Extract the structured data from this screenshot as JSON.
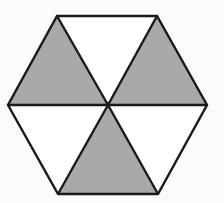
{
  "diagram": {
    "title": "",
    "shape": "regular hexagon divided into six triangles",
    "colors": {
      "background": "#fbfbfb",
      "shaded": "#a9a9a9",
      "unshaded": "#ffffff",
      "stroke": "#1a1a1a"
    },
    "stroke_width": 2.4,
    "center": [
      108,
      105
    ],
    "vertices": {
      "top_left": [
        57,
        16
      ],
      "top_right": [
        157,
        16
      ],
      "right": [
        207,
        105
      ],
      "bottom_right": [
        158,
        194
      ],
      "bottom_left": [
        58,
        194
      ],
      "left": [
        8,
        105
      ]
    },
    "triangles": [
      {
        "name": "top",
        "points": [
          "top_left",
          "top_right",
          "center"
        ],
        "shaded": false
      },
      {
        "name": "upper-right",
        "points": [
          "top_right",
          "right",
          "center"
        ],
        "shaded": true
      },
      {
        "name": "lower-right",
        "points": [
          "right",
          "bottom_right",
          "center"
        ],
        "shaded": false
      },
      {
        "name": "bottom",
        "points": [
          "bottom_right",
          "bottom_left",
          "center"
        ],
        "shaded": true
      },
      {
        "name": "lower-left",
        "points": [
          "bottom_left",
          "left",
          "center"
        ],
        "shaded": false
      },
      {
        "name": "upper-left",
        "points": [
          "left",
          "top_left",
          "center"
        ],
        "shaded": true
      }
    ],
    "shaded_count": 3,
    "total_count": 6
  }
}
